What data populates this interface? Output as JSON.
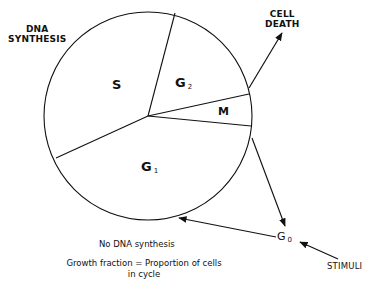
{
  "diagram": {
    "labels": {
      "dna_synthesis_line1": "DNA",
      "dna_synthesis_line2": "SYNTHESIS",
      "cell_death_line1": "CELL",
      "cell_death_line2": "DEATH",
      "stimuli": "STIMULI",
      "no_dna_synthesis": "No DNA synthesis",
      "growth_fraction_line1": "Growth fraction = Proportion of cells",
      "growth_fraction_line2": "in cycle"
    },
    "phases": [
      {
        "id": "S",
        "letter": "S",
        "subscript": ""
      },
      {
        "id": "G2",
        "letter": "G",
        "subscript": "2"
      },
      {
        "id": "M",
        "letter": "M",
        "subscript": ""
      },
      {
        "id": "G1",
        "letter": "G",
        "subscript": "1"
      },
      {
        "id": "G0",
        "letter": "G",
        "subscript": "0"
      }
    ],
    "arrows": [
      {
        "from": "cycle",
        "to": "CELL DEATH"
      },
      {
        "from": "cycle",
        "to": "G0"
      },
      {
        "from": "G0",
        "to": "G1"
      },
      {
        "from": "STIMULI",
        "to": "G0"
      }
    ],
    "colors": {
      "line": "#111111",
      "background": "#ffffff"
    }
  }
}
